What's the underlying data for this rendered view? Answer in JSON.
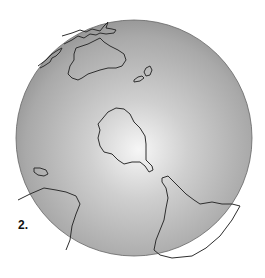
{
  "figure": {
    "label": "2.",
    "style": "grayscale shaded sphere with continent outlines",
    "colors": {
      "background": "#ffffff",
      "highlight": "#f4f4f4",
      "mid": "#b8b8b8",
      "shadow": "#8a8a8a",
      "outline": "#333333"
    },
    "globe": {
      "cx": 134,
      "cy": 138,
      "r": 118
    },
    "landmasses": [
      {
        "name": "australia",
        "position": "upper-left"
      },
      {
        "name": "new-zealand",
        "position": "upper-center-right"
      },
      {
        "name": "antarctica-like-center",
        "position": "center"
      },
      {
        "name": "south-america",
        "position": "lower-right"
      },
      {
        "name": "africa-tip",
        "position": "lower-left"
      },
      {
        "name": "madagascar-like-island",
        "position": "left"
      },
      {
        "name": "southeast-asia-islands",
        "position": "top-left"
      }
    ]
  }
}
